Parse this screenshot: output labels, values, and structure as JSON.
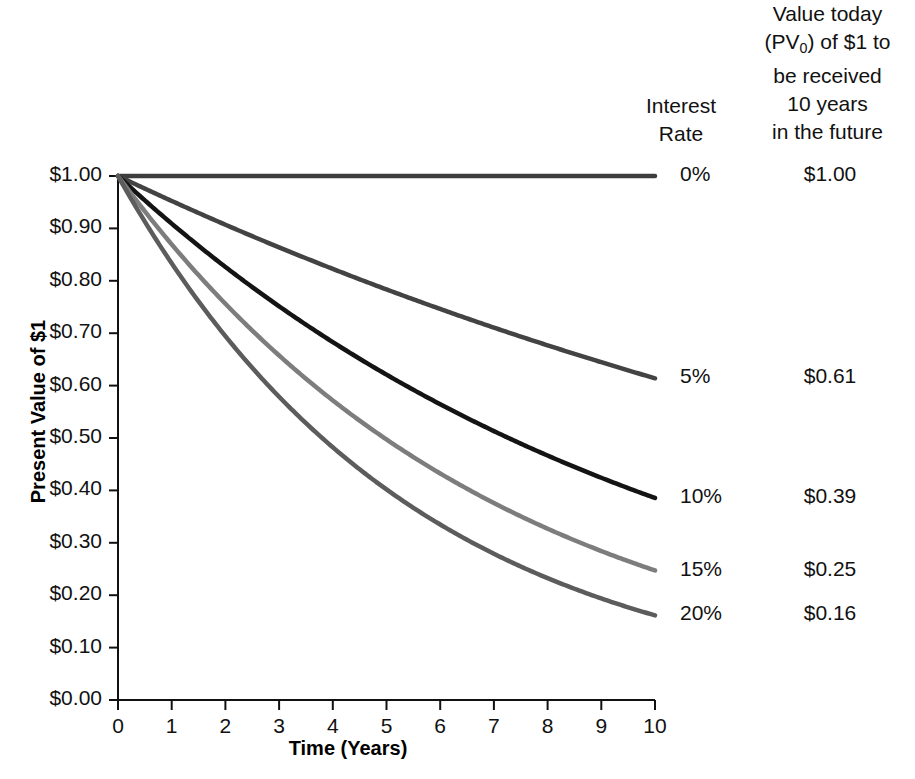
{
  "header": {
    "interest_col": "Interest\nRate",
    "interest_col_line1": "Interest",
    "interest_col_line2": "Rate",
    "value_col_line1": "Value today",
    "value_col_line2_a": "(PV",
    "value_col_line2_sub": "0",
    "value_col_line2_b": ") of $1 to",
    "value_col_line3": "be received",
    "value_col_line4": "10 years",
    "value_col_line5": "in the future"
  },
  "chart_data": {
    "type": "line",
    "title": "",
    "xlabel": "Time (Years)",
    "ylabel": "Present Value of $1",
    "xlim": [
      0,
      10
    ],
    "ylim": [
      0,
      1.0
    ],
    "grid": false,
    "legend_position": "right",
    "x": [
      0,
      1,
      2,
      3,
      4,
      5,
      6,
      7,
      8,
      9,
      10
    ],
    "xticks": [
      "0",
      "1",
      "2",
      "3",
      "4",
      "5",
      "6",
      "7",
      "8",
      "9",
      "10"
    ],
    "yticks": [
      "$0.00",
      "$0.10",
      "$0.20",
      "$0.30",
      "$0.40",
      "$0.50",
      "$0.60",
      "$0.70",
      "$0.80",
      "$0.90",
      "$1.00"
    ],
    "ytick_values": [
      0.0,
      0.1,
      0.2,
      0.3,
      0.4,
      0.5,
      0.6,
      0.7,
      0.8,
      0.9,
      1.0
    ],
    "series": [
      {
        "name": "0%",
        "rate": 0.0,
        "color": "#3d3d3d",
        "final_label": "$1.00",
        "values": [
          1.0,
          1.0,
          1.0,
          1.0,
          1.0,
          1.0,
          1.0,
          1.0,
          1.0,
          1.0,
          1.0
        ]
      },
      {
        "name": "5%",
        "rate": 0.05,
        "color": "#434343",
        "final_label": "$0.61",
        "values": [
          1.0,
          0.952,
          0.907,
          0.864,
          0.823,
          0.784,
          0.746,
          0.711,
          0.677,
          0.645,
          0.614
        ]
      },
      {
        "name": "10%",
        "rate": 0.1,
        "color": "#141414",
        "final_label": "$0.39",
        "values": [
          1.0,
          0.909,
          0.826,
          0.751,
          0.683,
          0.621,
          0.564,
          0.513,
          0.467,
          0.424,
          0.386
        ]
      },
      {
        "name": "15%",
        "rate": 0.15,
        "color": "#7d7d7d",
        "final_label": "$0.25",
        "values": [
          1.0,
          0.87,
          0.756,
          0.658,
          0.572,
          0.497,
          0.432,
          0.376,
          0.327,
          0.284,
          0.247
        ]
      },
      {
        "name": "20%",
        "rate": 0.2,
        "color": "#5c5c5c",
        "final_label": "$0.16",
        "values": [
          1.0,
          0.833,
          0.694,
          0.579,
          0.482,
          0.402,
          0.335,
          0.279,
          0.233,
          0.194,
          0.162
        ]
      }
    ]
  }
}
